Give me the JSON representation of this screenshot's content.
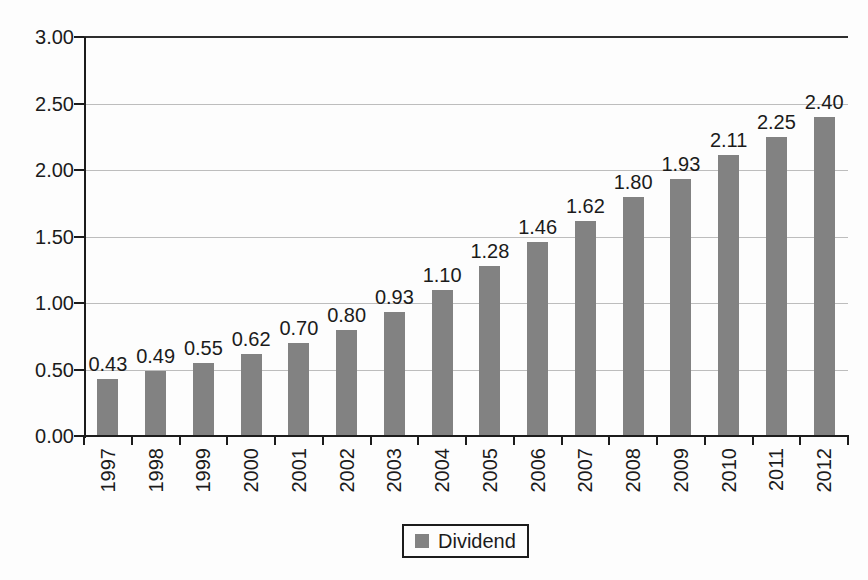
{
  "chart_data": {
    "type": "bar",
    "title": "",
    "xlabel": "",
    "ylabel": "",
    "categories": [
      "1997",
      "1998",
      "1999",
      "2000",
      "2001",
      "2002",
      "2003",
      "2004",
      "2005",
      "2006",
      "2007",
      "2008",
      "2009",
      "2010",
      "2011",
      "2012"
    ],
    "series": [
      {
        "name": "Dividend",
        "values": [
          0.43,
          0.49,
          0.55,
          0.62,
          0.7,
          0.8,
          0.93,
          1.1,
          1.28,
          1.46,
          1.62,
          1.8,
          1.93,
          2.11,
          2.25,
          2.4
        ],
        "value_labels": [
          "0.43",
          "0.49",
          "0.55",
          "0.62",
          "0.70",
          "0.80",
          "0.93",
          "1.10",
          "1.28",
          "1.46",
          "1.62",
          "1.80",
          "1.93",
          "2.11",
          "2.25",
          "2.40"
        ]
      }
    ],
    "ylim": [
      0,
      3
    ],
    "ytick_step": 0.5,
    "ytick_labels": [
      "0.00",
      "0.50",
      "1.00",
      "1.50",
      "2.00",
      "2.50",
      "3.00"
    ],
    "grid": "horizontal",
    "legend": [
      "Dividend"
    ],
    "legend_position": "bottom-center",
    "colors": {
      "bar": "#828282",
      "grid": "#bdbdbd",
      "top_border": "#2e2e2e",
      "axis": "#1c1c1c",
      "text": "#1b1b1b",
      "background": "#fdfdfd"
    }
  }
}
